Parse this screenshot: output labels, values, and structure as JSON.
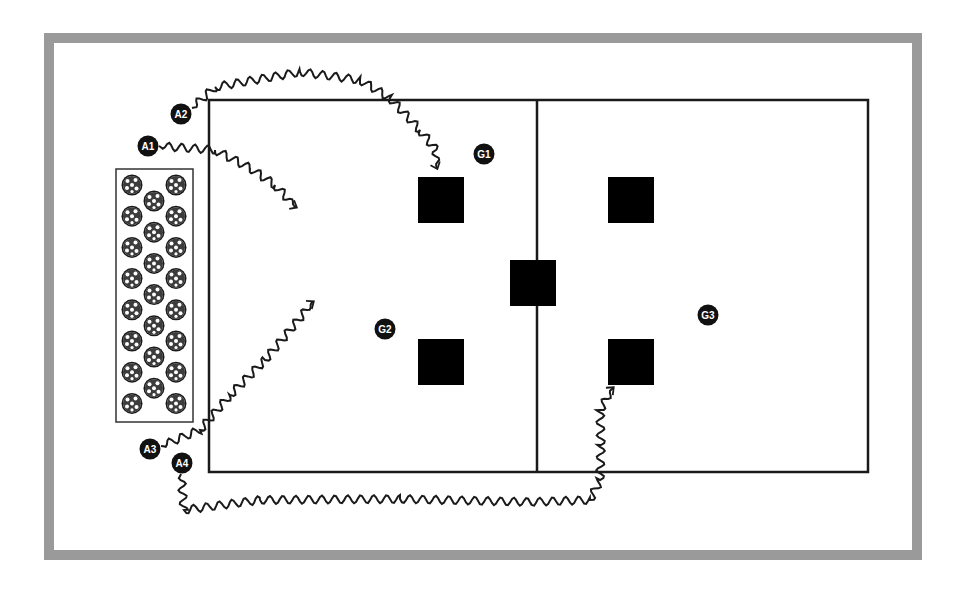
{
  "diagram": {
    "type": "soccer-drill",
    "colors": {
      "frame": "#9a9a9a",
      "lines": "#1a1a1a",
      "cones": "#000000",
      "player_fill": "#111111",
      "player_text": "#ffffff"
    },
    "field": {
      "x": 209,
      "y": 100,
      "width": 659,
      "height": 372,
      "midline_x": 537
    },
    "ball_bin": {
      "x": 116,
      "y": 169,
      "width": 77,
      "height": 253,
      "ball_count": 23
    },
    "cones": [
      {
        "id": "cone-1",
        "x": 418,
        "y": 177,
        "size": 46
      },
      {
        "id": "cone-2",
        "x": 418,
        "y": 339,
        "size": 46
      },
      {
        "id": "cone-3",
        "x": 510,
        "y": 260,
        "size": 46
      },
      {
        "id": "cone-4",
        "x": 608,
        "y": 177,
        "size": 46
      },
      {
        "id": "cone-5",
        "x": 608,
        "y": 339,
        "size": 46
      }
    ],
    "players": [
      {
        "id": "A1",
        "label": "A1",
        "x": 148,
        "y": 146
      },
      {
        "id": "A2",
        "label": "A2",
        "x": 181,
        "y": 114
      },
      {
        "id": "A3",
        "label": "A3",
        "x": 150,
        "y": 449
      },
      {
        "id": "A4",
        "label": "A4",
        "x": 182,
        "y": 463
      },
      {
        "id": "G1",
        "label": "G1",
        "x": 484,
        "y": 154
      },
      {
        "id": "G2",
        "label": "G2",
        "x": 385,
        "y": 329
      },
      {
        "id": "G3",
        "label": "G3",
        "x": 708,
        "y": 315
      }
    ]
  }
}
